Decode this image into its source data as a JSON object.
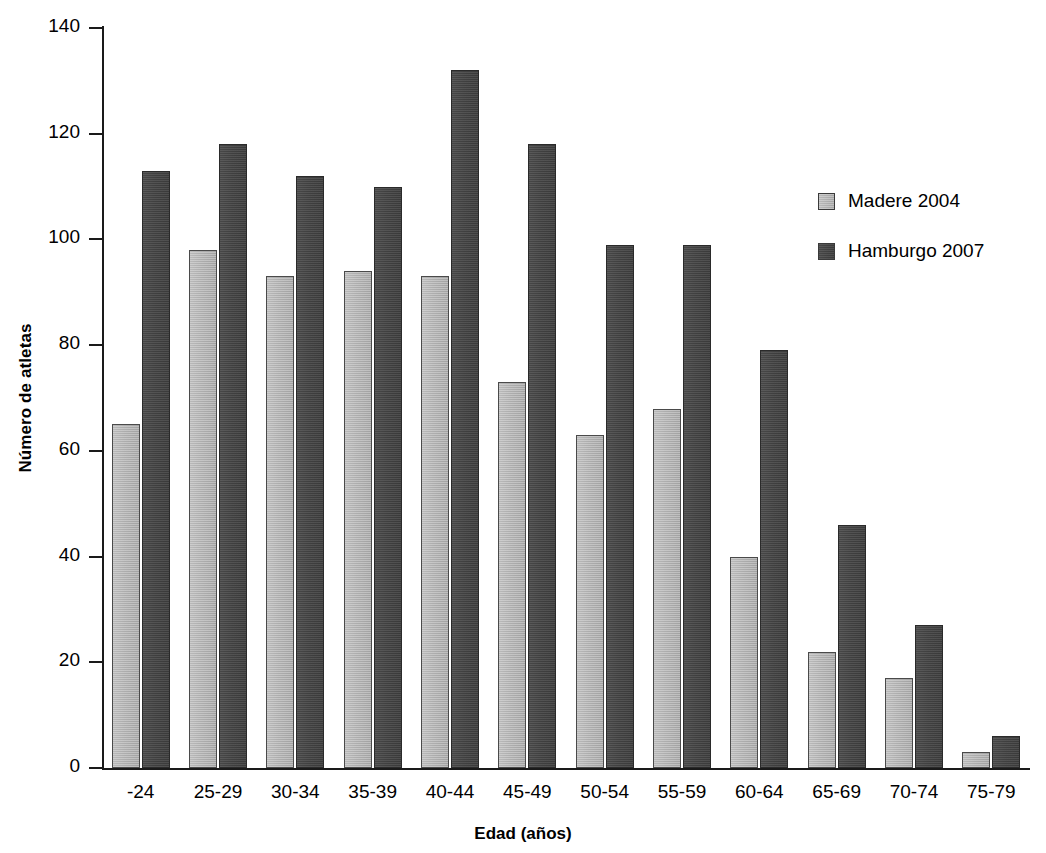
{
  "chart_data": {
    "type": "bar",
    "title": "",
    "xlabel": "Edad (años)",
    "ylabel": "Número de atletas",
    "categories": [
      "-24",
      "25-29",
      "30-34",
      "35-39",
      "40-44",
      "45-49",
      "50-54",
      "55-59",
      "60-64",
      "65-69",
      "70-74",
      "75-79"
    ],
    "series": [
      {
        "name": "Madere 2004",
        "color": "#ababab",
        "values": [
          65,
          98,
          93,
          94,
          93,
          73,
          63,
          68,
          40,
          22,
          17,
          3
        ]
      },
      {
        "name": "Hamburgo 2007",
        "color": "#3f3f3f",
        "values": [
          113,
          118,
          112,
          110,
          132,
          118,
          99,
          99,
          79,
          46,
          27,
          6
        ]
      }
    ],
    "ylim": [
      0,
      140
    ],
    "yticks": [
      0,
      20,
      40,
      60,
      80,
      100,
      120,
      140
    ],
    "ytick_labels": [
      "0",
      "20",
      "40",
      "60",
      "80",
      "100",
      "120",
      "140"
    ],
    "grid": false,
    "legend_position": "upper right"
  },
  "axes": {
    "y_title": "Número de atletas",
    "x_title": "Edad (años)"
  },
  "legend": {
    "entries": [
      {
        "label": "Madere 2004"
      },
      {
        "label": "Hamburgo 2007"
      }
    ]
  }
}
